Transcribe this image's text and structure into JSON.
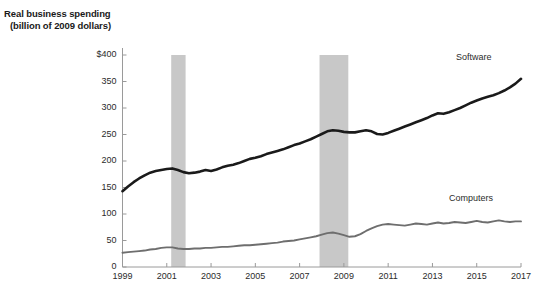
{
  "title": {
    "line1": "Real business spending",
    "line2": "(billion of 2009 dollars)"
  },
  "axes": {
    "y_ticks": [
      "$400",
      "350",
      "300",
      "250",
      "200",
      "150",
      "100",
      "50",
      "0"
    ],
    "x_ticks": [
      "1999",
      "2001",
      "2003",
      "2005",
      "2007",
      "2009",
      "2011",
      "2013",
      "2015",
      "2017"
    ]
  },
  "labels": {
    "software": "Software",
    "computers": "Computers"
  },
  "colors": {
    "software_line": "#1a1a1a",
    "computers_line": "#6e6e6e",
    "recession_band": "#c8c8c8",
    "axis": "#9a9a9a",
    "text": "#2b2b2b"
  },
  "chart_data": {
    "type": "line",
    "title": "Real business spending (billion of 2009 dollars)",
    "xlabel": "",
    "ylabel": "Real business spending (billion of 2009 dollars)",
    "xlim": [
      1999,
      2017
    ],
    "ylim": [
      0,
      400
    ],
    "ytick_values": [
      0,
      50,
      100,
      150,
      200,
      250,
      300,
      350,
      400
    ],
    "xtick_values": [
      1999,
      2001,
      2003,
      2005,
      2007,
      2009,
      2011,
      2013,
      2015,
      2017
    ],
    "grid": false,
    "legend": "inline-labels-right",
    "shaded_regions": [
      {
        "name": "recession-2001",
        "x_start": 2001.2,
        "x_end": 2001.85
      },
      {
        "name": "recession-2008",
        "x_start": 2007.9,
        "x_end": 2009.2
      }
    ],
    "x": [
      1999.0,
      1999.25,
      1999.5,
      1999.75,
      2000.0,
      2000.25,
      2000.5,
      2000.75,
      2001.0,
      2001.25,
      2001.5,
      2001.75,
      2002.0,
      2002.25,
      2002.5,
      2002.75,
      2003.0,
      2003.25,
      2003.5,
      2003.75,
      2004.0,
      2004.25,
      2004.5,
      2004.75,
      2005.0,
      2005.25,
      2005.5,
      2005.75,
      2006.0,
      2006.25,
      2006.5,
      2006.75,
      2007.0,
      2007.25,
      2007.5,
      2007.75,
      2008.0,
      2008.25,
      2008.5,
      2008.75,
      2009.0,
      2009.25,
      2009.5,
      2009.75,
      2010.0,
      2010.25,
      2010.5,
      2010.75,
      2011.0,
      2011.25,
      2011.5,
      2011.75,
      2012.0,
      2012.25,
      2012.5,
      2012.75,
      2013.0,
      2013.25,
      2013.5,
      2013.75,
      2014.0,
      2014.25,
      2014.5,
      2014.75,
      2015.0,
      2015.25,
      2015.5,
      2015.75,
      2016.0,
      2016.25,
      2016.5,
      2016.75,
      2017.0
    ],
    "series": [
      {
        "name": "Software",
        "color": "#1a1a1a",
        "values": [
          143,
          152,
          160,
          167,
          173,
          178,
          181,
          183,
          185,
          186,
          183,
          179,
          177,
          178,
          180,
          183,
          181,
          184,
          188,
          191,
          193,
          196,
          200,
          204,
          206,
          209,
          213,
          216,
          219,
          222,
          226,
          230,
          233,
          237,
          241,
          246,
          251,
          256,
          258,
          257,
          255,
          254,
          254,
          256,
          258,
          256,
          251,
          250,
          253,
          257,
          261,
          265,
          269,
          273,
          277,
          281,
          286,
          290,
          289,
          292,
          296,
          300,
          305,
          310,
          314,
          318,
          321,
          324,
          328,
          333,
          339,
          346,
          355
        ]
      },
      {
        "name": "Computers",
        "color": "#6e6e6e",
        "values": [
          27,
          28,
          29,
          30,
          31,
          33,
          34,
          36,
          37,
          37,
          35,
          34,
          34,
          35,
          35,
          36,
          36,
          37,
          38,
          38,
          39,
          40,
          41,
          41,
          42,
          43,
          44,
          45,
          46,
          48,
          49,
          50,
          52,
          54,
          56,
          58,
          61,
          64,
          65,
          63,
          60,
          57,
          58,
          62,
          68,
          73,
          77,
          80,
          81,
          80,
          79,
          78,
          80,
          82,
          81,
          80,
          82,
          84,
          82,
          83,
          85,
          84,
          83,
          85,
          87,
          85,
          84,
          86,
          88,
          86,
          85,
          86,
          86
        ]
      }
    ]
  }
}
